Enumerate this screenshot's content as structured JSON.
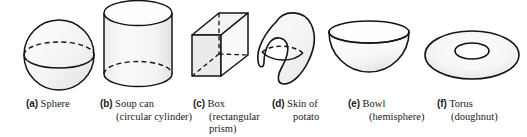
{
  "figure": {
    "background_color": "#ffffff",
    "stroke_color": "#141414",
    "fill_color": "#f2f2f2",
    "shade_color": "#e4e4e4",
    "items": [
      {
        "tag": "(a)",
        "name": "Sphere",
        "sub": "",
        "icon": "sphere-shape"
      },
      {
        "tag": "(b)",
        "name": "Soup can",
        "sub": "(circular cylinder)",
        "icon": "cylinder-shape"
      },
      {
        "tag": "(c)",
        "name": "Box",
        "sub": "(rectangular prism)",
        "sub_line1": "(rectangular",
        "sub_line2": "prism)",
        "icon": "box-shape"
      },
      {
        "tag": "(d)",
        "name": "Skin of",
        "sub": "potato",
        "icon": "potato-shape"
      },
      {
        "tag": "(e)",
        "name": "Bowl",
        "sub": "(hemisphere)",
        "icon": "bowl-shape"
      },
      {
        "tag": "(f)",
        "name": "Torus",
        "sub": "(doughnut)",
        "icon": "torus-shape"
      }
    ]
  }
}
